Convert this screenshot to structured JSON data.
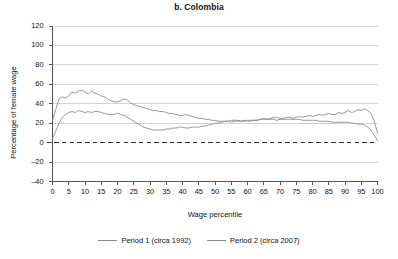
{
  "chart_data": {
    "type": "line",
    "title": "b. Colombia",
    "xlabel": "Wage percentile",
    "ylabel": "Percentage of female wage",
    "xlim": [
      0,
      100
    ],
    "ylim": [
      -40,
      120
    ],
    "yticks": [
      -40,
      -20,
      0,
      20,
      40,
      60,
      80,
      100,
      120
    ],
    "xticks": [
      0,
      5,
      10,
      15,
      20,
      25,
      30,
      35,
      40,
      45,
      50,
      55,
      60,
      65,
      70,
      75,
      80,
      85,
      90,
      95,
      100
    ],
    "grid": "horizontal",
    "zero_reference_line": 0,
    "zero_reference_style": "dashed",
    "legend_position": "bottom",
    "line_color": "#8c8c8c",
    "grid_color": "#c8c8c8",
    "axis_color": "#555555",
    "series": [
      {
        "name": "Period 1 (circa 1992)",
        "color": "#8c8c8c",
        "x": [
          0,
          1,
          2,
          3,
          4,
          5,
          6,
          7,
          8,
          9,
          10,
          11,
          12,
          13,
          14,
          15,
          16,
          17,
          18,
          19,
          20,
          21,
          22,
          23,
          24,
          25,
          26,
          27,
          28,
          29,
          30,
          31,
          32,
          33,
          34,
          35,
          36,
          37,
          38,
          39,
          40,
          41,
          42,
          43,
          44,
          45,
          46,
          47,
          48,
          49,
          50,
          51,
          52,
          53,
          54,
          55,
          56,
          57,
          58,
          59,
          60,
          61,
          62,
          63,
          64,
          65,
          66,
          67,
          68,
          69,
          70,
          71,
          72,
          73,
          74,
          75,
          76,
          77,
          78,
          79,
          80,
          81,
          82,
          83,
          84,
          85,
          86,
          87,
          88,
          89,
          90,
          91,
          92,
          93,
          94,
          95,
          96,
          97,
          98,
          99,
          100
        ],
        "y": [
          23,
          34,
          45,
          47,
          46,
          48,
          52,
          51,
          53,
          54,
          52,
          50,
          53,
          51,
          50,
          48,
          47,
          45,
          43,
          42,
          42,
          43,
          45,
          44,
          41,
          39,
          38,
          37,
          36,
          35,
          34,
          33,
          33,
          32,
          32,
          31,
          30,
          30,
          29,
          28,
          28,
          29,
          28,
          27,
          26,
          25,
          25,
          24,
          24,
          23,
          23,
          22,
          22,
          22,
          22,
          21,
          22,
          22,
          22,
          23,
          22,
          22,
          23,
          23,
          24,
          25,
          24,
          25,
          26,
          26,
          25,
          25,
          26,
          26,
          25,
          26,
          27,
          26,
          27,
          28,
          27,
          28,
          29,
          28,
          29,
          30,
          29,
          29,
          31,
          30,
          31,
          33,
          31,
          32,
          34,
          33,
          35,
          33,
          30,
          22,
          10
        ]
      },
      {
        "name": "Period 2 (circa 2007)",
        "color": "#8c8c8c",
        "x": [
          0,
          1,
          2,
          3,
          4,
          5,
          6,
          7,
          8,
          9,
          10,
          11,
          12,
          13,
          14,
          15,
          16,
          17,
          18,
          19,
          20,
          21,
          22,
          23,
          24,
          25,
          26,
          27,
          28,
          29,
          30,
          31,
          32,
          33,
          34,
          35,
          36,
          37,
          38,
          39,
          40,
          41,
          42,
          43,
          44,
          45,
          46,
          47,
          48,
          49,
          50,
          51,
          52,
          53,
          54,
          55,
          56,
          57,
          58,
          59,
          60,
          61,
          62,
          63,
          64,
          65,
          66,
          67,
          68,
          69,
          70,
          71,
          72,
          73,
          74,
          75,
          76,
          77,
          78,
          79,
          80,
          81,
          82,
          83,
          84,
          85,
          86,
          87,
          88,
          89,
          90,
          91,
          92,
          93,
          94,
          95,
          96,
          97,
          98,
          99,
          100
        ],
        "y": [
          4,
          12,
          20,
          26,
          29,
          31,
          32,
          31,
          33,
          32,
          31,
          32,
          31,
          32,
          32,
          31,
          30,
          29,
          29,
          29,
          30,
          29,
          28,
          26,
          24,
          22,
          20,
          18,
          16,
          15,
          14,
          13,
          13,
          13,
          13,
          14,
          14,
          15,
          15,
          16,
          16,
          15,
          15,
          16,
          16,
          16,
          17,
          17,
          18,
          19,
          20,
          20,
          21,
          22,
          22,
          23,
          23,
          23,
          22,
          22,
          23,
          23,
          23,
          23,
          24,
          24,
          24,
          24,
          24,
          23,
          24,
          24,
          24,
          24,
          24,
          24,
          24,
          23,
          23,
          23,
          23,
          23,
          22,
          22,
          22,
          22,
          21,
          21,
          21,
          21,
          21,
          21,
          20,
          20,
          19,
          19,
          18,
          16,
          13,
          8,
          2
        ]
      }
    ]
  },
  "legend": {
    "entries": [
      {
        "label": "Period 1 (circa 1992)"
      },
      {
        "label": "Period 2 (circa 2007)"
      }
    ]
  }
}
